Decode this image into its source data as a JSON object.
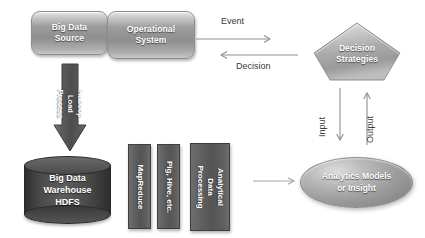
{
  "diagram": {
    "nodes": {
      "big_data_source": "Big Data\nSource",
      "operational_system": "Operational\nSystem",
      "decision_strategies": "Decision\nStrategies",
      "hadoop_load_process": "Hadoop Load\nProcess",
      "big_data_warehouse": "Big Data\nWarehouse\nHDFS",
      "mapreduce": "MapReduce",
      "pig_hive": "Pig, Hive, etc.",
      "analytical_data_processing": "Analytical\nData\nProcessing",
      "analytics_models": "Analytics Models\nor Insight"
    },
    "edges": {
      "event": "Event",
      "decision": "Decision",
      "input": "Input",
      "output": "Output"
    },
    "colors": {
      "box_fill": "#9d9d9d",
      "bar_fill": "#5d5d5d",
      "cylinder_fill": "#4a4a4a",
      "pentagon_fill": "#b0b0b0",
      "ellipse_fill": "#9b9b9b",
      "arrow_stroke": "#8f8f8f",
      "label_text": "#3a3a3a",
      "node_text": "#ffffff",
      "background": "#ffffff"
    }
  }
}
